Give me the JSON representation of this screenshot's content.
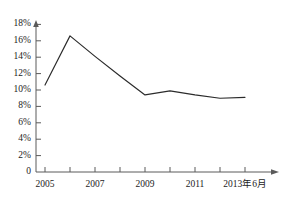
{
  "chart_data": {
    "type": "line",
    "title": "",
    "xlabel": "",
    "ylabel": "",
    "grid": false,
    "legend": null,
    "categories": [
      "2005",
      "2006",
      "2007",
      "2008",
      "2009",
      "2010",
      "2011",
      "2012",
      "2013年6月"
    ],
    "x_tick_labels": [
      "2005",
      "2007",
      "2009",
      "2011",
      "2013年6月"
    ],
    "y_tick_labels": [
      "18%",
      "16%",
      "14%",
      "12%",
      "10%",
      "8%",
      "6%",
      "4%",
      "2%",
      "0"
    ],
    "y_tick_values": [
      18,
      16,
      14,
      12,
      10,
      8,
      6,
      4,
      2,
      0
    ],
    "ylim": [
      0,
      19
    ],
    "values": [
      10.6,
      16.6,
      14.1,
      11.7,
      9.4,
      9.9,
      9.4,
      9.0,
      9.1
    ],
    "series": [
      {
        "name": "",
        "values": [
          10.6,
          16.6,
          14.1,
          11.7,
          9.4,
          9.9,
          9.4,
          9.0,
          9.1
        ]
      }
    ],
    "line_color": "#2b2b2b",
    "axis_color": "#555555"
  },
  "axes": {
    "y_labels": [
      {
        "text": "18%",
        "value": 18
      },
      {
        "text": "16%",
        "value": 16
      },
      {
        "text": "14%",
        "value": 14
      },
      {
        "text": "12%",
        "value": 12
      },
      {
        "text": "10%",
        "value": 10
      },
      {
        "text": "8%",
        "value": 8
      },
      {
        "text": "6%",
        "value": 6
      },
      {
        "text": "4%",
        "value": 4
      },
      {
        "text": "2%",
        "value": 2
      },
      {
        "text": "0",
        "value": 0
      }
    ],
    "x_labels": [
      {
        "text": "2005",
        "index": 0
      },
      {
        "text": "2007",
        "index": 2
      },
      {
        "text": "2009",
        "index": 4
      },
      {
        "text": "2011",
        "index": 6
      },
      {
        "text": "2013年6月",
        "index": 8
      }
    ]
  }
}
